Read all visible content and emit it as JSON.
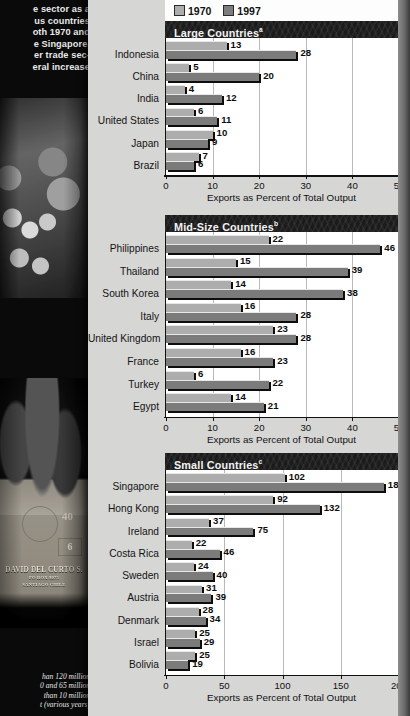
{
  "sidebar": {
    "intro_lines": [
      "e sector as a",
      "us  countries",
      "oth 1970 and",
      "e Singapore,",
      "er trade sec-",
      "eral increase"
    ],
    "photo_workers_name": "workers-with-plush-toys-photo",
    "crate": {
      "line1": "DAVID DEL CURTO S.",
      "line2": "PO BOX 9075",
      "line3": "SANTIAGO CHILE",
      "number": "40",
      "box_digit": "6"
    },
    "footnotes": [
      "han 120 million.",
      "0 and 65 million.",
      " than 10 million.",
      "t (various years)."
    ]
  },
  "legend": {
    "items": [
      {
        "label": "1970",
        "color": "#adadad"
      },
      {
        "label": "1997",
        "color": "#7d7d7d"
      }
    ]
  },
  "colors": {
    "series_1970": "#adadad",
    "series_1997": "#7b7b7b",
    "title_bar": "#1b1b1b",
    "panel_background": "#d6d6d4",
    "plot_background": "#ffffff",
    "gridline": "#b9b9b9",
    "axis": "#111111"
  },
  "chart_data": [
    {
      "type": "bar",
      "title": "Large Countries",
      "title_superscript": "a",
      "orientation": "horizontal",
      "grouped": true,
      "xlabel": "Exports as Percent of Total Output",
      "ylabel": "",
      "xlim": [
        0,
        50
      ],
      "xticks": [
        0,
        10,
        20,
        30,
        40,
        50
      ],
      "grid": true,
      "legend_position": "top",
      "categories": [
        "Indonesia",
        "China",
        "India",
        "United States",
        "Japan",
        "Brazil"
      ],
      "series": [
        {
          "name": "1970",
          "values": [
            13,
            5,
            4,
            6,
            10,
            7
          ]
        },
        {
          "name": "1997",
          "values": [
            28,
            20,
            12,
            11,
            9,
            6
          ]
        }
      ]
    },
    {
      "type": "bar",
      "title": "Mid-Size Countries",
      "title_superscript": "b",
      "orientation": "horizontal",
      "grouped": true,
      "xlabel": "Exports as Percent of Total Output",
      "ylabel": "",
      "xlim": [
        0,
        50
      ],
      "xticks": [
        0,
        10,
        20,
        30,
        40,
        50
      ],
      "grid": true,
      "legend_position": "top",
      "categories": [
        "Philippines",
        "Thailand",
        "South Korea",
        "Italy",
        "United Kingdom",
        "France",
        "Turkey",
        "Egypt"
      ],
      "series": [
        {
          "name": "1970",
          "values": [
            22,
            15,
            14,
            16,
            23,
            16,
            6,
            14
          ]
        },
        {
          "name": "1997",
          "values": [
            46,
            39,
            38,
            28,
            28,
            23,
            22,
            21
          ]
        }
      ]
    },
    {
      "type": "bar",
      "title": "Small Countries",
      "title_superscript": "c",
      "orientation": "horizontal",
      "grouped": true,
      "xlabel": "Exports as Percent of Total Output",
      "ylabel": "",
      "xlim": [
        0,
        200
      ],
      "xticks": [
        0,
        50,
        100,
        150,
        200
      ],
      "grid": true,
      "legend_position": "top",
      "categories": [
        "Singapore",
        "Hong Kong",
        "Ireland",
        "Costa Rica",
        "Sweden",
        "Austria",
        "Denmark",
        "Israel",
        "Bolivia"
      ],
      "series": [
        {
          "name": "1970",
          "values": [
            102,
            92,
            37,
            22,
            24,
            31,
            28,
            25,
            25
          ]
        },
        {
          "name": "1997",
          "values": [
            187,
            132,
            75,
            46,
            40,
            39,
            34,
            29,
            19
          ]
        }
      ]
    }
  ]
}
